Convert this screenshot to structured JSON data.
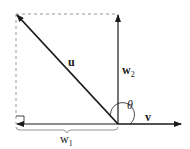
{
  "diagram": {
    "colors": {
      "line": "#1a1a1a",
      "dashed": "#999999",
      "background": "#ffffff"
    },
    "labels": {
      "u": "u",
      "w2_base": "w",
      "w2_sub": "2",
      "w1_base": "w",
      "w1_sub": "1",
      "v": "v",
      "theta": "θ"
    },
    "vectors": [
      {
        "name": "u",
        "from": [
          118,
          124
        ],
        "to": [
          16,
          14
        ]
      },
      {
        "name": "w2",
        "from": [
          118,
          124
        ],
        "to": [
          118,
          14
        ]
      },
      {
        "name": "w1",
        "from": [
          118,
          124
        ],
        "to": [
          16,
          124
        ]
      },
      {
        "name": "v",
        "from": [
          118,
          124
        ],
        "to": [
          182,
          124
        ]
      }
    ],
    "annotations": [
      "right-angle marker",
      "angle arc theta",
      "brace under w1",
      "dashed completion rectangle"
    ]
  }
}
